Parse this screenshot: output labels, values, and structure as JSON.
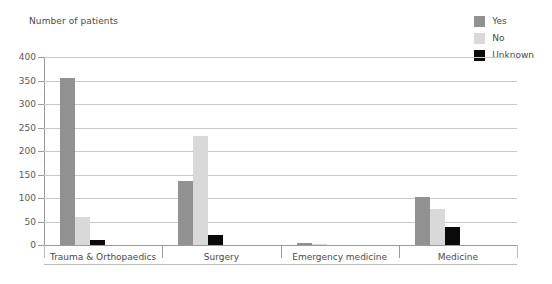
{
  "axis_title": "Number of patients",
  "legend": {
    "position": "top-right",
    "items": [
      {
        "label": "Yes",
        "color": "#919191",
        "swatch_name": "legend-swatch-yes"
      },
      {
        "label": "No",
        "color": "#d9d9d9",
        "swatch_name": "legend-swatch-no"
      },
      {
        "label": "Unknown",
        "color": "#0a0a0a",
        "swatch_name": "legend-swatch-unknown"
      }
    ]
  },
  "yticks": [
    "0",
    "50",
    "100",
    "150",
    "200",
    "250",
    "300",
    "350",
    "400"
  ],
  "chart_data": {
    "type": "bar",
    "title": "",
    "xlabel": "",
    "ylabel": "Number of patients",
    "ylim": [
      0,
      400
    ],
    "ytick_step": 50,
    "grid": true,
    "legend_position": "top-right",
    "categories": [
      "Trauma & Orthopaedics",
      "Surgery",
      "Emergency medicine",
      "Medicine"
    ],
    "series": [
      {
        "name": "Yes",
        "color": "#919191",
        "values": [
          355,
          137,
          4,
          102
        ]
      },
      {
        "name": "No",
        "color": "#d9d9d9",
        "values": [
          60,
          233,
          2,
          76
        ]
      },
      {
        "name": "Unknown",
        "color": "#0a0a0a",
        "values": [
          10,
          22,
          0,
          38
        ]
      }
    ]
  }
}
